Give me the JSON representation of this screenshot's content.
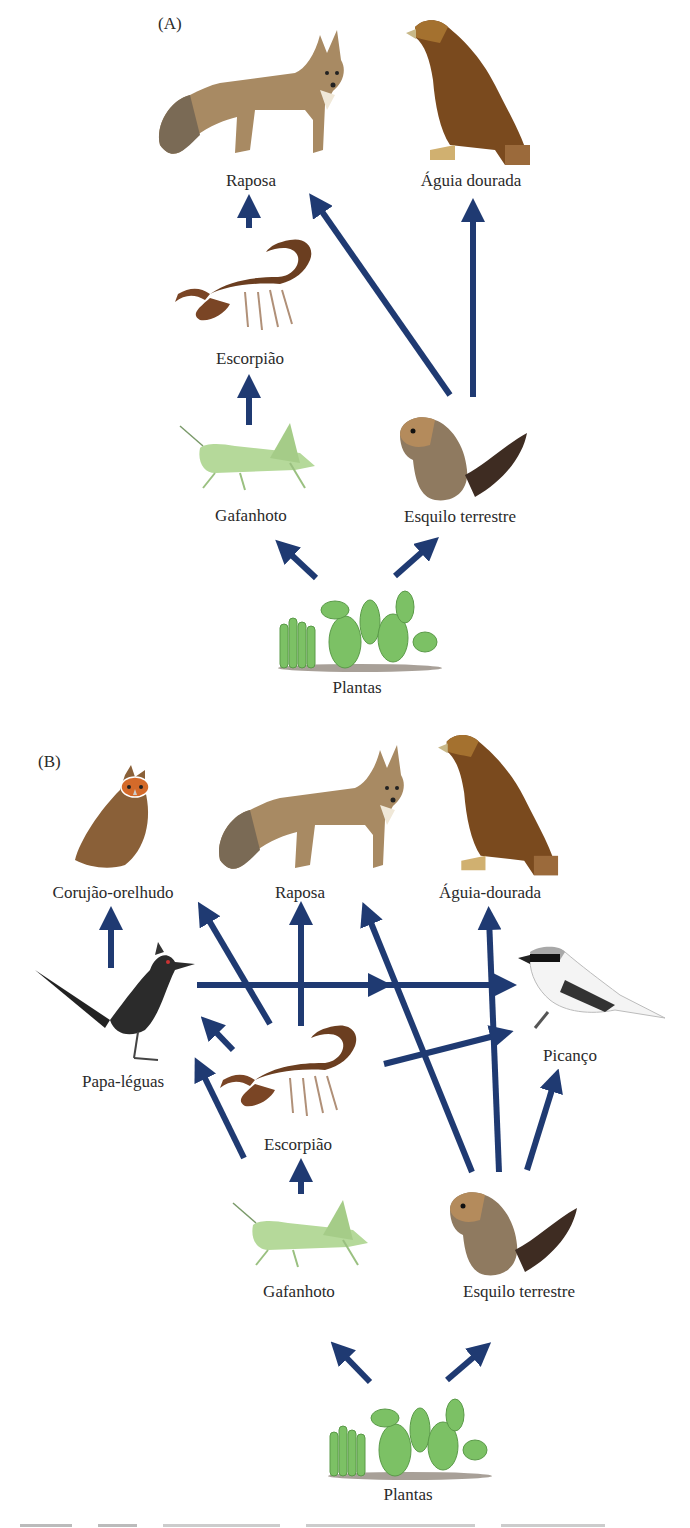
{
  "figure": {
    "panels": [
      {
        "id": "A",
        "label": "(A)",
        "organisms": {
          "fox": "Raposa",
          "eagle": "Águia dourada",
          "scorpion": "Escorpião",
          "grasshopper": "Gafanhoto",
          "squirrel": "Esquilo terrestre",
          "plants": "Plantas"
        },
        "links": [
          {
            "from": "Escorpião",
            "to": "Raposa"
          },
          {
            "from": "Esquilo terrestre",
            "to": "Raposa"
          },
          {
            "from": "Esquilo terrestre",
            "to": "Águia dourada"
          },
          {
            "from": "Gafanhoto",
            "to": "Escorpião"
          },
          {
            "from": "Plantas",
            "to": "Gafanhoto"
          },
          {
            "from": "Plantas",
            "to": "Esquilo terrestre"
          }
        ]
      },
      {
        "id": "B",
        "label": "(B)",
        "organisms": {
          "owl": "Corujão-orelhudo",
          "fox": "Raposa",
          "eagle": "Águia-dourada",
          "roadrunner": "Papa-léguas",
          "shrike": "Picanço",
          "scorpion": "Escorpião",
          "grasshopper": "Gafanhoto",
          "squirrel": "Esquilo terrestre",
          "plants": "Plantas"
        },
        "links": [
          {
            "from": "Papa-léguas",
            "to": "Corujão-orelhudo"
          },
          {
            "from": "Escorpião",
            "to": "Corujão-orelhudo"
          },
          {
            "from": "Escorpião",
            "to": "Raposa"
          },
          {
            "from": "Esquilo terrestre",
            "to": "Raposa"
          },
          {
            "from": "Esquilo terrestre",
            "to": "Águia-dourada"
          },
          {
            "from": "Papa-léguas",
            "to": "Picanço"
          },
          {
            "from": "Escorpião",
            "to": "Papa-léguas"
          },
          {
            "from": "Escorpião",
            "to": "Picanço"
          },
          {
            "from": "Gafanhoto",
            "to": "Papa-léguas"
          },
          {
            "from": "Esquilo terrestre",
            "to": "Picanço"
          },
          {
            "from": "Gafanhoto",
            "to": "Escorpião"
          },
          {
            "from": "Plantas",
            "to": "Gafanhoto"
          },
          {
            "from": "Plantas",
            "to": "Esquilo terrestre"
          }
        ]
      }
    ],
    "arrow_color": "#1f3a72"
  }
}
